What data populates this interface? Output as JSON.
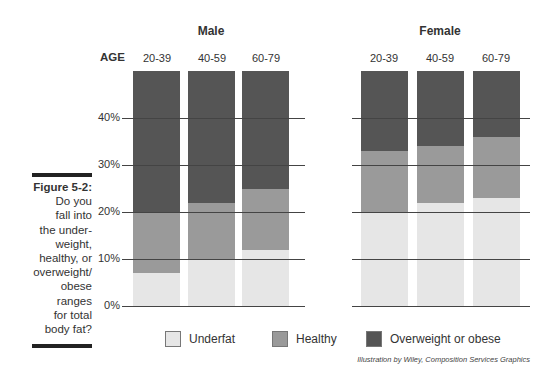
{
  "caption": {
    "figure_label": "Figure 5-2:",
    "lines": [
      "Do you",
      "fall into",
      "the under-",
      "weight,",
      "healthy, or",
      "overweight/",
      "obese",
      "ranges",
      "for total",
      "body fat?"
    ]
  },
  "credit": "Illustration by Wiley, Composition Services Graphics",
  "age_label": "AGE",
  "colors": {
    "underfat": "#e6e6e6",
    "healthy": "#9a9a9a",
    "overweight": "#555555"
  },
  "legend": [
    {
      "key": "underfat",
      "label": "Underfat"
    },
    {
      "key": "healthy",
      "label": "Healthy"
    },
    {
      "key": "overweight",
      "label": "Overweight or obese"
    }
  ],
  "y_ticks": [
    "0%",
    "10%",
    "20%",
    "30%",
    "40%"
  ],
  "chart_data": {
    "type": "bar",
    "stacked": true,
    "title": "",
    "xlabel": "AGE",
    "ylabel": "",
    "ylim": [
      0,
      50
    ],
    "grid": true,
    "legend_position": "bottom",
    "groups": [
      {
        "name": "Male",
        "categories": [
          "20-39",
          "40-59",
          "60-79"
        ],
        "thresholds": {
          "underfat_upper": [
            7,
            10,
            12
          ],
          "healthy_upper": [
            20,
            22,
            25
          ]
        },
        "series": [
          {
            "name": "Underfat",
            "values": [
              7,
              10,
              12
            ]
          },
          {
            "name": "Healthy",
            "values": [
              13,
              12,
              13
            ]
          },
          {
            "name": "Overweight or obese",
            "values": [
              30,
              28,
              25
            ]
          }
        ]
      },
      {
        "name": "Female",
        "categories": [
          "20-39",
          "40-59",
          "60-79"
        ],
        "thresholds": {
          "underfat_upper": [
            20,
            22,
            23
          ],
          "healthy_upper": [
            33,
            34,
            36
          ]
        },
        "series": [
          {
            "name": "Underfat",
            "values": [
              20,
              22,
              23
            ]
          },
          {
            "name": "Healthy",
            "values": [
              13,
              12,
              13
            ]
          },
          {
            "name": "Overweight or obese",
            "values": [
              17,
              16,
              14
            ]
          }
        ]
      }
    ]
  }
}
